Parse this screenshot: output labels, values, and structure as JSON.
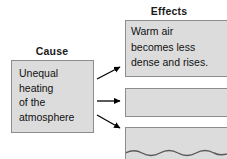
{
  "diagram": {
    "type": "cause-and-effect",
    "cause": {
      "heading": "Cause",
      "text": "Unequal heating of the atmosphere",
      "lines": [
        "Unequal",
        "heating",
        "of the",
        "atmosphere"
      ]
    },
    "effects": {
      "heading": "Effects",
      "items": [
        {
          "id": "effect-1",
          "text": "Warm air becomes less dense and rises.",
          "lines": [
            "Warm air",
            "becomes less",
            "dense and rises."
          ],
          "empty": false
        },
        {
          "id": "effect-2",
          "text": "",
          "lines": [],
          "empty": true
        },
        {
          "id": "effect-3",
          "text": "",
          "lines": [],
          "empty": true,
          "decoration": "wavy-line"
        }
      ]
    },
    "arrows": [
      {
        "id": "arrow-to-effect-1",
        "direction": "up-right"
      },
      {
        "id": "arrow-to-effect-2",
        "direction": "right"
      },
      {
        "id": "arrow-to-effect-3",
        "direction": "down-right"
      }
    ],
    "colors": {
      "box_fill": "#dcdcdc",
      "box_border": "#8c8c8c",
      "text": "#111111",
      "heading": "#1a1a1a",
      "arrow": "#000000",
      "background": "#ffffff"
    }
  }
}
